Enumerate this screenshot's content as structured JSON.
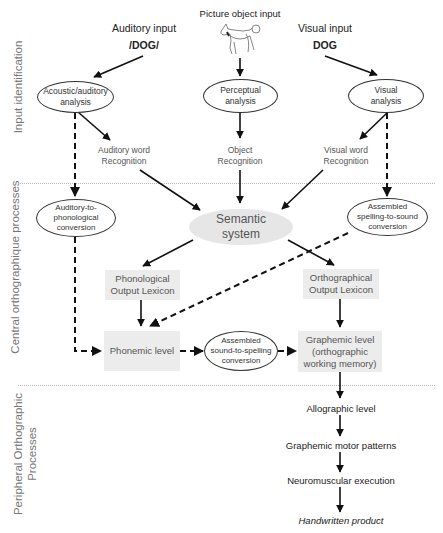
{
  "sections": [
    {
      "label": "Input identification"
    },
    {
      "label": "Central orthographique processes"
    },
    {
      "label": "Peripheral Orthographic\nProcesses"
    }
  ],
  "inputs": {
    "auditory": {
      "title": "Auditory input",
      "value": "/DOG/"
    },
    "picture": {
      "title": "Picture object input",
      "icon": "dog-drawing-icon"
    },
    "visual": {
      "title": "Visual input",
      "value": "DOG"
    }
  },
  "nodes": {
    "acoustic": "Acoustic/auditory\nanalysis",
    "perceptual": "Perceptual\nanalysis",
    "visual_analysis": "Visual\nanalysis",
    "auditory_word": "Auditory word\nRecognition",
    "object_recognition": "Object\nRecognition",
    "visual_word": "Visual word\nRecognition",
    "auditory_phon": "Auditory-to-\nphonological\nconversion",
    "semantic": "Semantic\nsystem",
    "assembled_sts": "Assembled\nspelling-to-sound\nconversion",
    "phon_lexicon": "Phonological\nOutput Lexicon",
    "orth_lexicon": "Orthographical\nOutput Lexicon",
    "phonemic": "Phonemic level",
    "assembled_sts2": "Assembled\nsound-to-spelling\nconversion",
    "graphemic": "Graphemic level\n(orthographic\nworking memory)",
    "allographic": "Allographic level",
    "motor": "Graphemic motor patterns",
    "neuromuscular": "Neuromuscular execution",
    "product": "Handwritten product"
  },
  "colors": {
    "box_fill": "#ececec",
    "semantic_fill": "#e6e6e6",
    "line": "#111111",
    "section_text": "#777777"
  }
}
